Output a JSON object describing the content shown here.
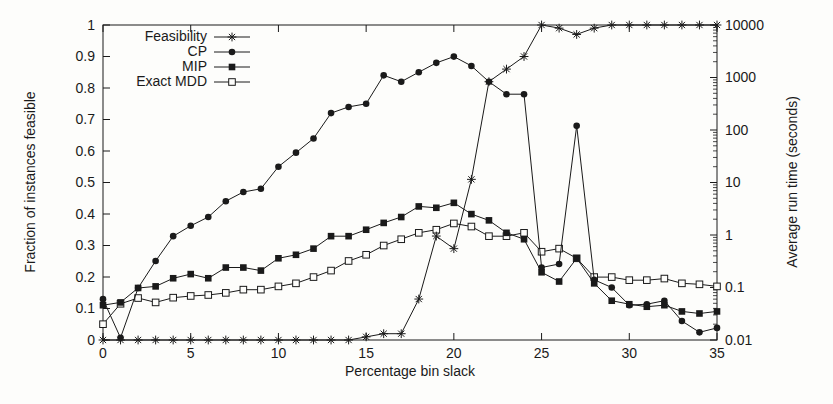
{
  "figure": {
    "background": "#fdfdfb",
    "ink_color": "#1a1a1a"
  },
  "titles": {
    "x_axis": "Percentage bin slack",
    "y_left_axis": "Fraction of instances feasible",
    "y_right_axis": "Average run time (seconds)"
  },
  "legend": {
    "position": "top-left",
    "entries": [
      {
        "label": "Feasibility",
        "marker": "asterisk"
      },
      {
        "label": "CP",
        "marker": "filled-circle"
      },
      {
        "label": "MIP",
        "marker": "filled-square"
      },
      {
        "label": "Exact MDD",
        "marker": "open-square"
      }
    ]
  },
  "chart_data": {
    "type": "line",
    "title": "",
    "xlabel": "Percentage bin slack",
    "ylabel_left": "Fraction of instances feasible",
    "ylabel_right": "Average run time (seconds)",
    "x_range": [
      0,
      35
    ],
    "x_tick_values": [
      0,
      5,
      10,
      15,
      20,
      25,
      30,
      35
    ],
    "x_tick_labels": [
      "0",
      "5",
      "10",
      "15",
      "20",
      "25",
      "30",
      "35"
    ],
    "y_left_range": [
      0,
      1
    ],
    "y_left_tick_values": [
      0,
      0.1,
      0.2,
      0.3,
      0.4,
      0.5,
      0.6,
      0.7,
      0.8,
      0.9,
      1
    ],
    "y_left_tick_labels": [
      "0",
      "0.1",
      "0.2",
      "0.3",
      "0.4",
      "0.5",
      "0.6",
      "0.7",
      "0.8",
      "0.9",
      "1"
    ],
    "y_right_scale": "log",
    "y_right_range": [
      0.01,
      10000
    ],
    "y_right_tick_values": [
      0.01,
      0.1,
      1,
      10,
      100,
      1000,
      10000
    ],
    "y_right_tick_labels": [
      "0.01",
      "0.1",
      "1",
      "10",
      "100",
      "1000",
      "10000"
    ],
    "grid": false,
    "x": [
      0,
      1,
      2,
      3,
      4,
      5,
      6,
      7,
      8,
      9,
      10,
      11,
      12,
      13,
      14,
      15,
      16,
      17,
      18,
      19,
      20,
      21,
      22,
      23,
      24,
      25,
      26,
      27,
      28,
      29,
      30,
      31,
      32,
      33,
      34,
      35
    ],
    "series": [
      {
        "name": "Feasibility",
        "axis": "left",
        "marker": "asterisk",
        "units": "fraction",
        "values": [
          0,
          0,
          0,
          0,
          0,
          0,
          0,
          0,
          0,
          0,
          0,
          0,
          0,
          0,
          0,
          0.01,
          0.02,
          0.02,
          0.13,
          0.33,
          0.29,
          0.51,
          0.82,
          0.86,
          0.9,
          1.0,
          0.99,
          0.97,
          0.99,
          1.0,
          1.0,
          1.0,
          1.0,
          1.0,
          1.0,
          1.0
        ]
      },
      {
        "name": "CP",
        "axis": "right",
        "marker": "filled-circle",
        "units": "seconds",
        "values": [
          0.06,
          0.011,
          0.098,
          0.32,
          0.95,
          1.5,
          2.2,
          4.4,
          6.6,
          7.6,
          20,
          37,
          69,
          210,
          275,
          316,
          1100,
          830,
          1260,
          1900,
          2500,
          1660,
          830,
          480,
          480,
          0.24,
          0.28,
          120,
          0.14,
          0.1,
          0.046,
          0.048,
          0.056,
          0.023,
          0.014,
          0.017
        ]
      },
      {
        "name": "MIP",
        "axis": "right",
        "marker": "filled-square",
        "units": "seconds",
        "values": [
          0.046,
          0.052,
          0.098,
          0.105,
          0.15,
          0.18,
          0.15,
          0.24,
          0.24,
          0.21,
          0.36,
          0.42,
          0.55,
          0.95,
          0.95,
          1.26,
          1.7,
          2.2,
          3.5,
          3.3,
          4.1,
          2.5,
          1.9,
          1.1,
          0.83,
          0.195,
          0.13,
          0.36,
          0.12,
          0.056,
          0.048,
          0.043,
          0.046,
          0.035,
          0.032,
          0.035
        ]
      },
      {
        "name": "Exact MDD",
        "axis": "right",
        "marker": "open-square",
        "units": "seconds",
        "values": [
          0.02,
          0.049,
          0.063,
          0.052,
          0.064,
          0.069,
          0.072,
          0.079,
          0.091,
          0.091,
          0.105,
          0.12,
          0.158,
          0.21,
          0.32,
          0.42,
          0.63,
          0.83,
          1.1,
          1.26,
          1.66,
          1.45,
          0.95,
          0.95,
          1.1,
          0.48,
          0.55,
          0.36,
          0.158,
          0.158,
          0.138,
          0.138,
          0.148,
          0.12,
          0.115,
          0.105
        ]
      }
    ]
  }
}
